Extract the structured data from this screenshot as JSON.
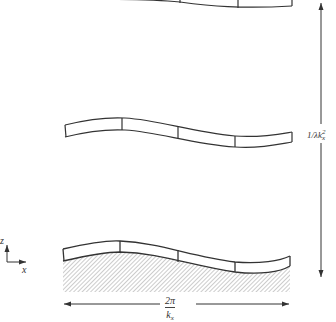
{
  "figure": {
    "strips": [
      {
        "name": "top-strip",
        "position": "top",
        "clipped": true
      },
      {
        "name": "middle-strip",
        "position": "middle",
        "clipped": false
      },
      {
        "name": "bottom-strip",
        "position": "bottom",
        "clipped": false
      }
    ],
    "substrate": {
      "name": "hatched-substrate",
      "pattern": "diagonal-hatch"
    },
    "horizontal_dimension": {
      "numerator": "2π",
      "denominator_base": "k",
      "denominator_sub": "x"
    },
    "vertical_dimension": {
      "label_prefix": "1/λk",
      "label_sub": "x",
      "label_sup": "2"
    },
    "axes": {
      "vertical_label": "z",
      "horizontal_label": "x"
    },
    "colors": {
      "line": "#333333",
      "hatch": "#9a9a9a",
      "background": "#ffffff"
    }
  }
}
